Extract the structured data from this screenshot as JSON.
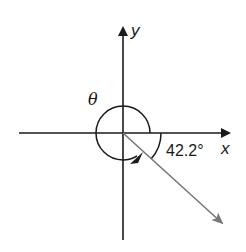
{
  "diagram": {
    "title": "",
    "labels": {
      "x_axis": "x",
      "y_axis": "y",
      "theta": "θ",
      "reference_angle": "42.2°"
    },
    "angle_values": {
      "reference_angle_deg": 42.2,
      "vector_quadrant": "IV"
    },
    "colors": {
      "axes": "#1a1a1a",
      "arcs": "#1a1a1a",
      "vector": "#777777",
      "text": "#1a1a1a",
      "background": "#ffffff"
    }
  }
}
